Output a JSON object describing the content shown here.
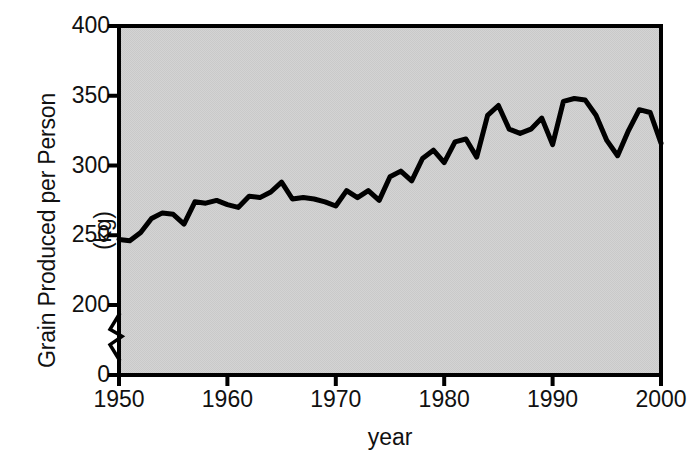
{
  "chart_data": {
    "type": "line",
    "title": "",
    "xlabel": "year",
    "ylabel": "Grain Produced per Person (kg)",
    "ylabel_main": "Grain Produced per Person",
    "ylabel_unit": "(kg)",
    "xlim": [
      1950,
      2000
    ],
    "ylim": [
      0,
      400
    ],
    "y_axis_break": true,
    "y_break_between": [
      0,
      200
    ],
    "grid": false,
    "legend": null,
    "xticks": [
      1950,
      1960,
      1970,
      1980,
      1990,
      2000
    ],
    "xtick_labels": [
      "1950",
      "1960",
      "1970",
      "1980",
      "1990",
      "2000"
    ],
    "yticks": [
      0,
      200,
      250,
      300,
      350,
      400
    ],
    "ytick_labels": [
      "0",
      "200",
      "250",
      "300",
      "350",
      "400"
    ],
    "plot_background": "#d2d2d2",
    "line_color": "#000000",
    "line_width": 5,
    "series": [
      {
        "name": "Grain produced per person",
        "x": [
          1950,
          1951,
          1952,
          1953,
          1954,
          1955,
          1956,
          1957,
          1958,
          1959,
          1960,
          1961,
          1962,
          1963,
          1964,
          1965,
          1966,
          1967,
          1968,
          1969,
          1970,
          1971,
          1972,
          1973,
          1974,
          1975,
          1976,
          1977,
          1978,
          1979,
          1980,
          1981,
          1982,
          1983,
          1984,
          1985,
          1986,
          1987,
          1988,
          1989,
          1990,
          1991,
          1992,
          1993
        ],
        "values": [
          247,
          246,
          252,
          262,
          266,
          265,
          258,
          274,
          273,
          275,
          272,
          270,
          278,
          277,
          281,
          288,
          276,
          277,
          276,
          274,
          271,
          282,
          277,
          282,
          275,
          292,
          296,
          289,
          305,
          311,
          302,
          317,
          319,
          306,
          336,
          343,
          326,
          323,
          326,
          334,
          315,
          346,
          348,
          347
        ],
        "values_tail": [
          336,
          318,
          307,
          325,
          340,
          338,
          316,
          322,
          321,
          306
        ]
      }
    ]
  },
  "axes": {
    "y_break_symbol": "zigzag"
  }
}
